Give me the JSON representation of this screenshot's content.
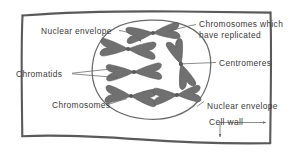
{
  "figure": {
    "colors": {
      "background": "#ffffff",
      "cell_wall": "#5a5a5a",
      "nuclear_envelope": "#6a6a6a",
      "chromosome": "#707070",
      "chromosome_outline": "#4f4f4f",
      "leader_line": "#666666",
      "label_text": "#3a3a3a"
    }
  },
  "labels": {
    "nuclear_envelope_top": "Nuclear envelope",
    "chromosomes_replicated_line1": "Chromosomes which",
    "chromosomes_replicated_line2": "have replicated",
    "centromeres": "Centromeres",
    "chromatids": "Chromatids",
    "chromosomes": "Chromosomes",
    "nuclear_envelope_bottom": "Nuclear envelope",
    "cell_wall": "Cell wall"
  },
  "structures": {
    "cell_wall_name": "cell-wall",
    "nucleus_name": "nuclear-envelope",
    "chromosome_count": 6
  }
}
